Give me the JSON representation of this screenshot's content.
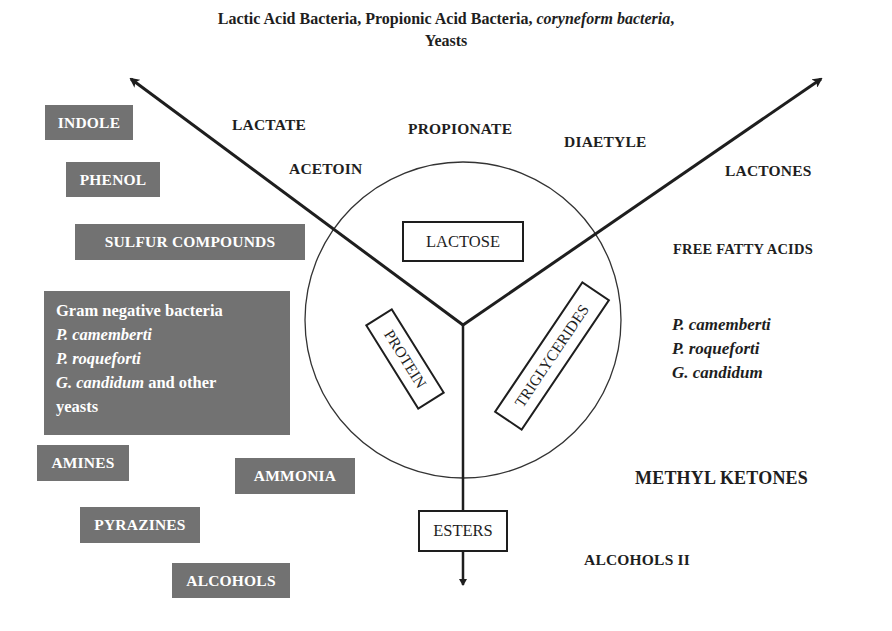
{
  "title": {
    "line1_plain": "Lactic Acid Bacteria, Propionic Acid Bacteria, ",
    "line1_italic": "coryneform bacteria",
    "line1_end": ",",
    "line2": "Yeasts"
  },
  "center": {
    "substrates": [
      "LACTOSE",
      "PROTEIN",
      "TRIGLYCERIDES"
    ],
    "lactose": "LACTOSE",
    "protein": "PROTEIN",
    "triglycerides": "TRIGLYCERIDES",
    "esters": "ESTERS"
  },
  "lactose_products": {
    "lactate": "LACTATE",
    "propionate": "PROPIONATE",
    "acetoin": "ACETOIN",
    "diaetyle": "DIAETYLE"
  },
  "lipid_products": {
    "lactones": "LACTONES",
    "free_fatty_acids": "FREE FATTY ACIDS",
    "organisms": [
      "P. camemberti",
      "P. roqueforti",
      "G. candidum"
    ],
    "methyl_ketones": "METHYL KETONES",
    "alcohols_ii": "ALCOHOLS II"
  },
  "protein_products": {
    "indole": "INDOLE",
    "phenol": "PHENOL",
    "sulfur_compounds": "SULFUR COMPOUNDS",
    "organisms_box": {
      "line1": "Gram negative bacteria",
      "line2": "P. camemberti",
      "line3": "P. roqueforti",
      "line4_italic": "G. candidum",
      "line4_plain": " and other",
      "line5": "yeasts"
    },
    "amines": "AMINES",
    "ammonia": "AMMONIA",
    "pyrazines": "PYRAZINES",
    "alcohols": "ALCOHOLS"
  },
  "colors": {
    "gray_box": "#727272",
    "ink": "#1e1e1e",
    "background": "#ffffff"
  }
}
